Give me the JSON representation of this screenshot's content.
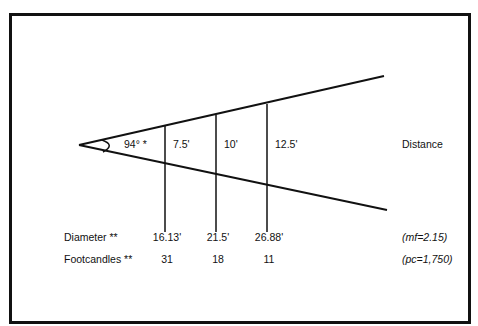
{
  "diagram": {
    "angle_label": "94° *",
    "distance_label": "Distance",
    "distances": [
      "7.5'",
      "10'",
      "12.5'"
    ],
    "row_labels": {
      "diameter": "Diameter **",
      "footcandles": "Footcandles **"
    },
    "diameters": [
      "16.13'",
      "21.5'",
      "26.88'"
    ],
    "footcandles": [
      "31",
      "18",
      "11"
    ],
    "notes": {
      "mf": "(mf=2.15)",
      "pc": "(pc=1,750)"
    }
  }
}
